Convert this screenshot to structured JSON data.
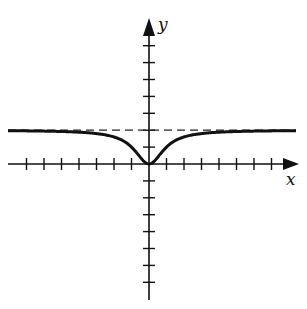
{
  "chart_data": {
    "type": "line",
    "title": "",
    "xlabel": "x",
    "ylabel": "y",
    "xlim": [
      -7,
      8
    ],
    "ylim": [
      -8,
      8
    ],
    "grid": false,
    "x_ticks": [
      -7,
      -6,
      -5,
      -4,
      -3,
      -2,
      -1,
      1,
      2,
      3,
      4,
      5,
      6,
      7
    ],
    "y_ticks": [
      -7,
      -6,
      -5,
      -4,
      -3,
      -2,
      -1,
      1,
      2,
      3,
      4,
      5,
      6,
      7
    ],
    "series": [
      {
        "name": "curve",
        "style": "solid",
        "function": "y = 2x^2/(x^2+1)",
        "x": [
          -8,
          -7,
          -6,
          -5,
          -4,
          -3,
          -2,
          -1.5,
          -1,
          -0.5,
          0,
          0.5,
          1,
          1.5,
          2,
          3,
          4,
          5,
          6,
          7,
          8
        ],
        "values": [
          1.97,
          1.96,
          1.95,
          1.92,
          1.88,
          1.8,
          1.6,
          1.38,
          1.0,
          0.4,
          0,
          0.4,
          1.0,
          1.38,
          1.6,
          1.8,
          1.88,
          1.92,
          1.95,
          1.96,
          1.97
        ]
      },
      {
        "name": "horizontal asymptote",
        "style": "dashed",
        "function": "y = 2",
        "x": [
          -8,
          8
        ],
        "values": [
          2,
          2
        ]
      }
    ],
    "colors": {
      "axis": "#111111",
      "curve": "#111111",
      "asymptote": "#222222"
    }
  },
  "labels": {
    "x_axis": "x",
    "y_axis": "y"
  }
}
